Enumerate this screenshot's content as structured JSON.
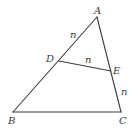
{
  "figure": {
    "type": "triangle-with-segment",
    "points": {
      "A": {
        "label": "A",
        "x": 97,
        "y": 17
      },
      "B": {
        "label": "B",
        "x": 13,
        "y": 112
      },
      "C": {
        "label": "C",
        "x": 121,
        "y": 112
      },
      "D": {
        "label": "D",
        "x": 59,
        "y": 61
      },
      "E": {
        "label": "E",
        "x": 111,
        "y": 71
      }
    },
    "segment_labels": {
      "AD": "n",
      "DE": "n",
      "EC": "n"
    },
    "colors": {
      "stroke": "#3a3a3a",
      "background": "#ffffff"
    }
  }
}
